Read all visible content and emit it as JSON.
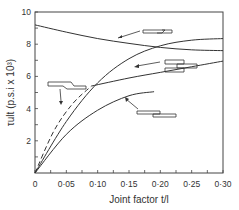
{
  "chart_data": {
    "type": "line",
    "title": "",
    "xlabel": "Joint factor t/l",
    "ylabel": "τult (p.s.i x 10³)",
    "xlim": [
      0,
      0.3
    ],
    "ylim": [
      0,
      10
    ],
    "x_ticks": [
      "0",
      "0·05",
      "0·10",
      "0·15",
      "0·20",
      "0·25",
      "0·30"
    ],
    "y_ticks": [
      "2",
      "4",
      "6",
      "8",
      "10"
    ],
    "grid": false,
    "legend": "none (joint-geometry sketches with arrows point to each curve)",
    "series": [
      {
        "name": "scarf joint",
        "style": "solid",
        "x": [
          0,
          0.05,
          0.1,
          0.15,
          0.2,
          0.25,
          0.3
        ],
        "y": [
          9.2,
          8.75,
          8.35,
          8.05,
          7.8,
          7.65,
          7.6
        ]
      },
      {
        "name": "double-strap joint",
        "style": "solid",
        "x": [
          0,
          0.05,
          0.1,
          0.15,
          0.2,
          0.25,
          0.3
        ],
        "y": [
          0,
          3.2,
          5.6,
          7.1,
          7.9,
          8.25,
          8.35
        ]
      },
      {
        "name": "stepped lap joint",
        "style": "dashed-then-solid",
        "x": [
          0,
          0.03,
          0.06,
          0.09,
          0.15,
          0.2,
          0.25,
          0.3
        ],
        "y": [
          0,
          2.6,
          4.3,
          5.4,
          5.9,
          6.25,
          6.6,
          6.95
        ]
      },
      {
        "name": "single lap joint",
        "style": "solid",
        "x": [
          0,
          0.05,
          0.1,
          0.15,
          0.19
        ],
        "y": [
          0,
          2.4,
          3.9,
          4.8,
          5.05
        ]
      }
    ]
  }
}
